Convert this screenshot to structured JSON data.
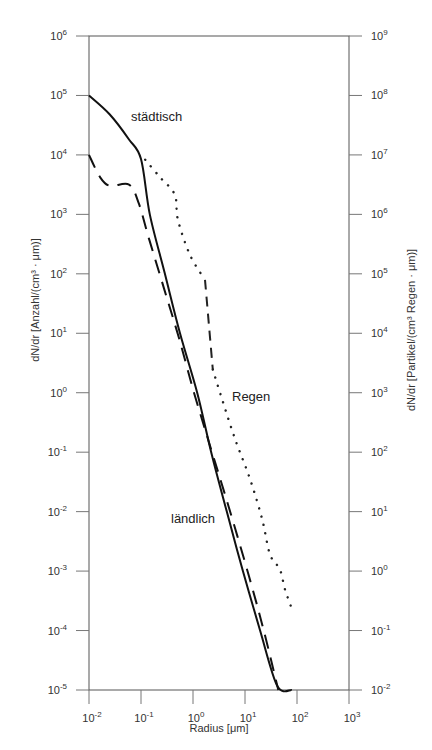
{
  "chart_data": {
    "type": "line",
    "title": "",
    "xlabel": "Radius [μm]",
    "ylabel_left": "dN/dr [Anzahl/(cm³ · μm)]",
    "ylabel_right": "dN/dr [Partikel/(cm³ Regen · μm)]",
    "xscale": "log",
    "yscale": "log",
    "xlim": [
      0.01,
      1000
    ],
    "ylim_left": [
      1e-05,
      1000000.0
    ],
    "ylim_right": [
      0.01,
      1000000000.0
    ],
    "grid": false,
    "legend": "inline labels",
    "x_ticks": [
      {
        "base": "10",
        "exp": "-2"
      },
      {
        "base": "10",
        "exp": "-1"
      },
      {
        "base": "10",
        "exp": "0"
      },
      {
        "base": "10",
        "exp": "1"
      },
      {
        "base": "10",
        "exp": "2"
      },
      {
        "base": "10",
        "exp": "3"
      }
    ],
    "y_ticks_left": [
      {
        "base": "10",
        "exp": "6"
      },
      {
        "base": "10",
        "exp": "5"
      },
      {
        "base": "10",
        "exp": "4"
      },
      {
        "base": "10",
        "exp": "3"
      },
      {
        "base": "10",
        "exp": "2"
      },
      {
        "base": "10",
        "exp": "1"
      },
      {
        "base": "10",
        "exp": "0"
      },
      {
        "base": "10",
        "exp": "-1"
      },
      {
        "base": "10",
        "exp": "-2"
      },
      {
        "base": "10",
        "exp": "-3"
      },
      {
        "base": "10",
        "exp": "-4"
      },
      {
        "base": "10",
        "exp": "-5"
      }
    ],
    "y_ticks_right": [
      {
        "base": "10",
        "exp": "9"
      },
      {
        "base": "10",
        "exp": "8"
      },
      {
        "base": "10",
        "exp": "7"
      },
      {
        "base": "10",
        "exp": "6"
      },
      {
        "base": "10",
        "exp": "5"
      },
      {
        "base": "10",
        "exp": "4"
      },
      {
        "base": "10",
        "exp": "3"
      },
      {
        "base": "10",
        "exp": "2"
      },
      {
        "base": "10",
        "exp": "1"
      },
      {
        "base": "10",
        "exp": "0"
      },
      {
        "base": "10",
        "exp": "-1"
      },
      {
        "base": "10",
        "exp": "-2"
      }
    ],
    "series": [
      {
        "name": "städtisch",
        "style": "solid",
        "axis": "left",
        "log10_x": [
          -2.0,
          -1.6,
          -1.23,
          -1.0,
          -0.83,
          -0.54,
          -0.25,
          0.08,
          0.35,
          0.65,
          0.96,
          1.29,
          1.62,
          1.9
        ],
        "log10_y": [
          5.0,
          4.68,
          4.26,
          3.93,
          3.0,
          2.0,
          1.0,
          0.0,
          -1.0,
          -2.0,
          -3.0,
          -4.0,
          -4.93,
          -5.0
        ],
        "x": [
          0.01,
          0.025,
          0.059,
          0.1,
          0.15,
          0.29,
          0.56,
          1.2,
          2.2,
          4.5,
          9.1,
          19.5,
          41.7,
          79.4
        ],
        "y": [
          100000.0,
          48000.0,
          18000.0,
          8500.0,
          1000.0,
          100.0,
          10.0,
          1.0,
          0.1,
          0.01,
          0.001,
          0.0001,
          1.2e-05,
          1e-05
        ]
      },
      {
        "name": "ländlich",
        "style": "dashed",
        "axis": "left",
        "log10_x": [
          -2.0,
          -1.79,
          -1.6,
          -1.23,
          -1.04,
          -0.85,
          -0.56,
          -0.27,
          0.02,
          0.31,
          0.69,
          1.08,
          1.37,
          1.64
        ],
        "log10_y": [
          4.0,
          3.63,
          3.48,
          3.5,
          3.18,
          2.6,
          1.76,
          0.92,
          0.0,
          -0.84,
          -1.93,
          -3.1,
          -4.03,
          -5.0
        ],
        "x": [
          0.01,
          0.016,
          0.025,
          0.059,
          0.091,
          0.14,
          0.28,
          0.54,
          1.05,
          2.0,
          4.9,
          12.0,
          23.4,
          43.7
        ],
        "y": [
          10000.0,
          4300.0,
          3000.0,
          3200.0,
          1500.0,
          400.0,
          58,
          8.3,
          1.0,
          0.14,
          0.012,
          0.0008,
          9e-05,
          1e-05
        ]
      },
      {
        "name": "Regen",
        "style": "dotted (with dashed drop segment)",
        "axis": "right",
        "log10_x": [
          -0.92,
          -0.63,
          -0.35,
          -0.29,
          -0.06,
          0.23,
          0.38,
          0.56,
          0.81,
          1.1,
          1.33,
          1.48,
          1.67,
          1.77,
          1.92
        ],
        "log10_y_right": [
          6.92,
          6.62,
          6.33,
          5.91,
          5.32,
          4.9,
          3.39,
          2.89,
          2.22,
          1.54,
          0.87,
          0.28,
          0.03,
          -0.31,
          -0.68
        ],
        "x": [
          0.12,
          0.23,
          0.45,
          0.51,
          0.87,
          1.7,
          2.4,
          3.6,
          6.5,
          12.6,
          21.4,
          30.2,
          46.8,
          58.9,
          83.2
        ],
        "y": [
          8300000.0,
          4200000.0,
          2100000.0,
          810000.0,
          210000.0,
          79000.0,
          2500.0,
          780.0,
          170.0,
          35,
          7.4,
          1.9,
          1.1,
          0.49,
          0.21
        ]
      }
    ],
    "annotations": [
      {
        "text": "städtisch",
        "near": "upper left, solid curve"
      },
      {
        "text": "Regen",
        "near": "center right, dotted curve"
      },
      {
        "text": "ländlich",
        "near": "lower middle, dashed curve"
      }
    ]
  },
  "labels": {
    "staedtisch": "städtisch",
    "regen": "Regen",
    "laendlich": "ländlich",
    "xlabel": "Radius [μm]",
    "ylabel_left": "dN/dr [Anzahl/(cm³ · μm)]",
    "ylabel_right": "dN/dr [Partikel/(cm³ Regen · μm)]"
  }
}
